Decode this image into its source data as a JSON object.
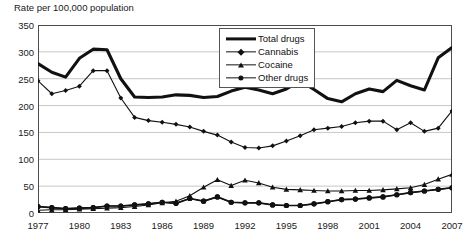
{
  "chart_data": {
    "type": "line",
    "title": "Rate per 100,000 population",
    "xlabel": "",
    "ylabel": "Rate per 100,000 population",
    "ylim": [
      0,
      350
    ],
    "yticks": [
      0,
      50,
      100,
      150,
      200,
      250,
      300,
      350
    ],
    "xlim": [
      1977,
      2007
    ],
    "xticks": [
      1977,
      1980,
      1983,
      1986,
      1989,
      1992,
      1995,
      1998,
      2001,
      2004,
      2007
    ],
    "grid": true,
    "legend_position": "top-center",
    "x": [
      1977,
      1978,
      1979,
      1980,
      1981,
      1982,
      1983,
      1984,
      1985,
      1986,
      1987,
      1988,
      1989,
      1990,
      1991,
      1992,
      1993,
      1994,
      1995,
      1996,
      1997,
      1998,
      1999,
      2000,
      2001,
      2002,
      2003,
      2004,
      2005,
      2006,
      2007
    ],
    "series": [
      {
        "name": "Total drugs",
        "marker": "none",
        "values": [
          278,
          262,
          253,
          288,
          305,
          304,
          250,
          216,
          215,
          216,
          220,
          219,
          215,
          217,
          227,
          234,
          229,
          222,
          231,
          246,
          230,
          213,
          207,
          222,
          231,
          226,
          247,
          237,
          229,
          289,
          308
        ]
      },
      {
        "name": "Cannabis",
        "marker": "diamond",
        "values": [
          246,
          222,
          228,
          236,
          265,
          265,
          214,
          178,
          172,
          169,
          165,
          160,
          152,
          145,
          132,
          122,
          121,
          125,
          134,
          144,
          155,
          158,
          161,
          168,
          171,
          171,
          155,
          168,
          152,
          158,
          190
        ]
      },
      {
        "name": "Cocaine",
        "marker": "triangle",
        "values": [
          5,
          6,
          6,
          7,
          8,
          9,
          10,
          12,
          15,
          19,
          22,
          32,
          48,
          62,
          51,
          61,
          56,
          48,
          44,
          43,
          42,
          41,
          41,
          42,
          42,
          43,
          45,
          47,
          53,
          63,
          72
        ]
      },
      {
        "name": "Other drugs",
        "marker": "circle",
        "values": [
          12,
          10,
          8,
          9,
          10,
          13,
          13,
          15,
          17,
          20,
          18,
          27,
          22,
          30,
          20,
          19,
          19,
          15,
          14,
          14,
          17,
          21,
          25,
          26,
          28,
          30,
          34,
          38,
          41,
          44,
          47
        ]
      }
    ]
  },
  "legend": {
    "items": [
      {
        "label": "Total drugs",
        "marker": "none"
      },
      {
        "label": "Cannabis",
        "marker": "diamond"
      },
      {
        "label": "Cocaine",
        "marker": "triangle"
      },
      {
        "label": "Other drugs",
        "marker": "circle"
      }
    ]
  },
  "colors": {
    "line": "#111111",
    "grid": "#b9b9b9",
    "frame": "#4d4d4d",
    "background": "#ffffff"
  }
}
